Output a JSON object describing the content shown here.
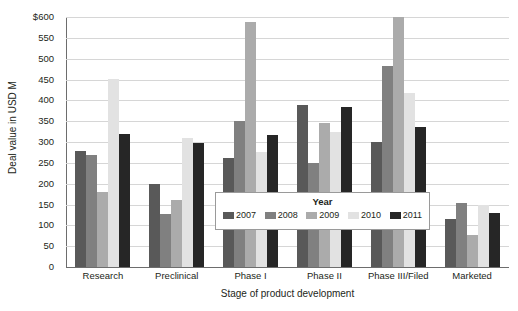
{
  "chart_data": {
    "type": "bar",
    "title": "",
    "xlabel": "Stage of product development",
    "ylabel": "Deal value in USD M",
    "ylim": [
      0,
      600
    ],
    "ytick_labels": [
      "$600",
      "550",
      "500",
      "450",
      "400",
      "350",
      "300",
      "250",
      "200",
      "150",
      "100",
      "50",
      "0"
    ],
    "ytick_values": [
      600,
      550,
      500,
      450,
      400,
      350,
      300,
      250,
      200,
      150,
      100,
      50,
      0
    ],
    "grid": true,
    "legend_position": "center",
    "legend_title": "Year",
    "categories": [
      "Research",
      "Preclinical",
      "Phase I",
      "Phase II",
      "Phase III/Filed",
      "Marketed"
    ],
    "series": [
      {
        "name": "2007",
        "color": "#595959",
        "values": [
          279,
          200,
          262,
          390,
          300,
          115
        ]
      },
      {
        "name": "2008",
        "color": "#808080",
        "values": [
          268,
          128,
          350,
          250,
          483,
          153
        ]
      },
      {
        "name": "2009",
        "color": "#ababab",
        "values": [
          179,
          160,
          588,
          345,
          600,
          78
        ]
      },
      {
        "name": "2010",
        "color": "#e2e2e2",
        "values": [
          452,
          310,
          275,
          325,
          418,
          148
        ]
      },
      {
        "name": "2011",
        "color": "#262626",
        "values": [
          319,
          297,
          318,
          385,
          337,
          130
        ]
      }
    ]
  }
}
